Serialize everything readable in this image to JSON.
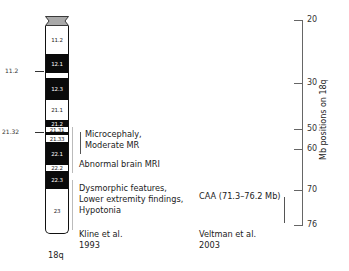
{
  "chromosome": {
    "name": "18q",
    "cap_color": "#a9a9a9",
    "bands": [
      {
        "label": "11.2",
        "top": 10,
        "height": 28,
        "color": "white"
      },
      {
        "label": "12.1",
        "top": 38,
        "height": 19,
        "color": "black"
      },
      {
        "label": "",
        "top": 57,
        "height": 5,
        "color": "white"
      },
      {
        "label": "12.3",
        "top": 62,
        "height": 22,
        "color": "black"
      },
      {
        "label": "21.1",
        "top": 84,
        "height": 20,
        "color": "white"
      },
      {
        "label": "21.2",
        "top": 104,
        "height": 7,
        "color": "black"
      },
      {
        "label": "21.31",
        "top": 111,
        "height": 5,
        "color": "white"
      },
      {
        "label": "",
        "top": 116,
        "height": 3,
        "color": "black"
      },
      {
        "label": "21.33",
        "top": 119,
        "height": 7,
        "color": "white"
      },
      {
        "label": "22.1",
        "top": 126,
        "height": 23,
        "color": "black"
      },
      {
        "label": "22.2",
        "top": 149,
        "height": 6,
        "color": "white"
      },
      {
        "label": "22.3",
        "top": 155,
        "height": 18,
        "color": "black"
      },
      {
        "label": "23",
        "top": 173,
        "height": 45,
        "color": "white"
      }
    ],
    "markers": [
      {
        "label": "11.2",
        "y": 71
      },
      {
        "label": "21.32",
        "y": 132
      }
    ]
  },
  "kline": {
    "findings": [
      {
        "lines": [
          "Microcephaly,",
          "Moderate MR"
        ]
      },
      {
        "lines": [
          "Abnormal brain MRI"
        ]
      },
      {
        "lines": [
          "Dysmorphic features,",
          "Lower extremity findings,",
          "Hypotonia"
        ]
      }
    ],
    "citation": [
      "Kline et al.",
      "1993"
    ]
  },
  "veltman": {
    "finding": "CAA (71.3–76.2 Mb)",
    "citation": [
      "Veltman et al.",
      "2003"
    ]
  },
  "axis": {
    "title": "Mb positions on 18q",
    "ticks": [
      {
        "label": "20",
        "y": 20
      },
      {
        "label": "30",
        "y": 83
      },
      {
        "label": "50",
        "y": 129
      },
      {
        "label": "60",
        "y": 149
      },
      {
        "label": "70",
        "y": 190
      },
      {
        "label": "76",
        "y": 225
      }
    ]
  }
}
